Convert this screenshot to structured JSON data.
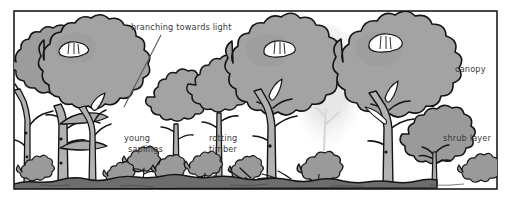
{
  "figure": {
    "kind": "forest-structure-illustration",
    "frame": {
      "border_color": "#1c1c1c",
      "background_color": "#ffffff"
    },
    "palette": {
      "outline": "#141414",
      "canopy_gray": "#a3a3a3",
      "canopy_gray_dark": "#8e8e8e",
      "trunk_gray": "#adadad",
      "shrub_gray": "#9a9a9a",
      "ground_gray": "#6d6d6d",
      "haze_gray": "#e2e2e2",
      "gap_white": "#ffffff",
      "label_text": "#3a3a3a"
    }
  },
  "labels": [
    {
      "id": "branching-towards-light",
      "text": "branching towards light",
      "x": 131,
      "y": 30,
      "anchor": "start",
      "has_leader_line": true,
      "leader": {
        "x1": 161,
        "y1": 35,
        "x2": 124,
        "y2": 107
      }
    },
    {
      "id": "young-saplings",
      "text": "young saplings",
      "line1": "young",
      "line2": "saplings",
      "x": 124,
      "y": 141,
      "anchor": "start",
      "has_leader_line": false
    },
    {
      "id": "rotting-timber",
      "text": "rotting timber",
      "line1": "rotting",
      "line2": "timber",
      "x": 209,
      "y": 141,
      "anchor": "start",
      "has_leader_line": false
    },
    {
      "id": "canopy",
      "text": "canopy",
      "x": 455,
      "y": 72,
      "anchor": "start",
      "has_leader_line": false
    },
    {
      "id": "shrub-layer",
      "text": "shrub layer",
      "x": 443,
      "y": 141,
      "anchor": "start",
      "has_leader_line": false
    }
  ],
  "scene_elements": [
    {
      "id": "canopy-tree-left-rear",
      "name": "large canopy tree (far left, rear)"
    },
    {
      "id": "canopy-tree-left-front",
      "name": "large canopy tree (left, front)"
    },
    {
      "id": "canopy-gap-left",
      "name": "light gap in left canopy"
    },
    {
      "id": "sapling-tall-a",
      "name": "young sapling (mid-left)"
    },
    {
      "id": "sapling-tall-b",
      "name": "young sapling (mid-centre)"
    },
    {
      "id": "canopy-tree-centre",
      "name": "large canopy tree (centre)"
    },
    {
      "id": "canopy-gap-centre",
      "name": "light gap in centre canopy"
    },
    {
      "id": "haze-tree",
      "name": "faded distant tree in canopy gap"
    },
    {
      "id": "canopy-tree-right",
      "name": "large canopy tree (right)"
    },
    {
      "id": "canopy-gap-right",
      "name": "light gap in right canopy"
    },
    {
      "id": "shrub-large-right",
      "name": "large shrub below right canopy tree"
    },
    {
      "id": "forest-floor",
      "name": "forest floor / ground line"
    },
    {
      "id": "rotting-logs",
      "name": "fallen rotting timber on forest floor"
    },
    {
      "id": "floor-shrubs",
      "name": "low shrubs and seedlings on forest floor"
    }
  ]
}
